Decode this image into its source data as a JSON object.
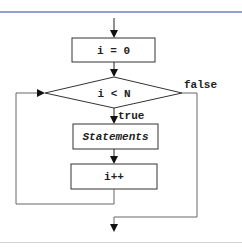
{
  "diagram": {
    "type": "flowchart",
    "nodes": {
      "init": {
        "label": "i = 0",
        "shape": "rectangle"
      },
      "condition": {
        "label": "i < N",
        "shape": "diamond"
      },
      "body": {
        "label": "Statements",
        "shape": "rectangle"
      },
      "increment": {
        "label": "i++",
        "shape": "rectangle"
      }
    },
    "edges": {
      "true_label": "true",
      "false_label": "false"
    },
    "colors": {
      "stroke": "#333333",
      "loop_line": "#666666",
      "top_rule": "#8f9fd0",
      "bottom_rule": "#cfd3d8"
    }
  }
}
